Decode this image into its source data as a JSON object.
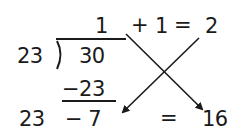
{
  "diagram": {
    "type": "long-division-cross-method",
    "division": {
      "divisor": "23",
      "dividend": "30",
      "quotient": "1",
      "subtracted": "−23",
      "remainder_expression": "− 7"
    },
    "top_equation": {
      "plus": "+",
      "addend": "1",
      "equals": "=",
      "result": "2"
    },
    "bottom_equation": {
      "left": "23",
      "equals": "=",
      "result": "16"
    },
    "arrows": [
      {
        "from": "quotient-area",
        "to": "16"
      },
      {
        "from": "2",
        "to": "7"
      }
    ],
    "colors": {
      "ink": "#1a1a1a",
      "background": "#ffffff"
    }
  }
}
